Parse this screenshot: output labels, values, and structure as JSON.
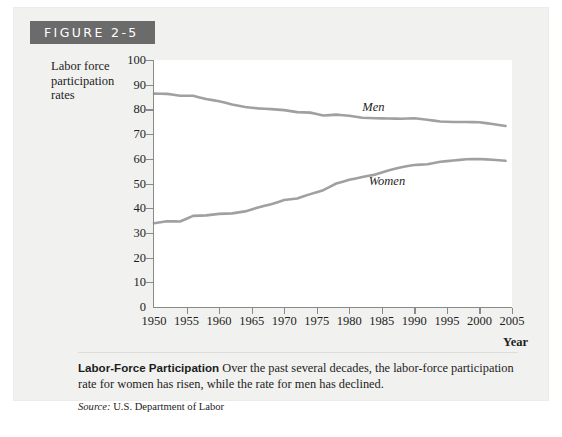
{
  "figure": {
    "number_label": "FIGURE 2-5",
    "header_bg": "#6b6b6b",
    "panel_bg": "#f1f1ef"
  },
  "caption": {
    "lead": "Labor-Force Participation",
    "body": "Over the past several decades, the labor-force participation rate for women has risen, while the rate for men has declined.",
    "source_label": "Source:",
    "source_value": "U.S. Department of Labor"
  },
  "chart_data": {
    "type": "line",
    "title": "",
    "xlabel": "Year",
    "ylabel": "Labor force participation rates",
    "ylabel_lines": [
      "Labor force",
      "participation",
      "rates"
    ],
    "xlim": [
      1950,
      2005
    ],
    "ylim": [
      0,
      100
    ],
    "xticks": [
      1950,
      1955,
      1960,
      1965,
      1970,
      1975,
      1980,
      1985,
      1990,
      1995,
      2000,
      2005
    ],
    "yticks": [
      0,
      10,
      20,
      30,
      40,
      50,
      60,
      70,
      80,
      90,
      100
    ],
    "grid": false,
    "legend": "inline-labels",
    "line_color": "#a0a0a0",
    "series": [
      {
        "name": "Men",
        "label_x": 1982,
        "label_y": 80.5,
        "x": [
          1950,
          1952,
          1954,
          1956,
          1958,
          1960,
          1962,
          1964,
          1966,
          1968,
          1970,
          1972,
          1974,
          1976,
          1978,
          1980,
          1982,
          1984,
          1986,
          1988,
          1990,
          1992,
          1994,
          1996,
          1998,
          2000,
          2002,
          2004
        ],
        "values": [
          86.4,
          86.3,
          85.5,
          85.5,
          84.2,
          83.3,
          82.0,
          81.0,
          80.4,
          80.1,
          79.7,
          78.9,
          78.7,
          77.5,
          77.9,
          77.4,
          76.6,
          76.4,
          76.3,
          76.2,
          76.4,
          75.8,
          75.1,
          74.9,
          74.9,
          74.8,
          74.1,
          73.3
        ]
      },
      {
        "name": "Women",
        "label_x": 1983,
        "label_y": 50.5,
        "x": [
          1950,
          1952,
          1954,
          1956,
          1958,
          1960,
          1962,
          1964,
          1966,
          1968,
          1970,
          1972,
          1974,
          1976,
          1978,
          1980,
          1982,
          1984,
          1986,
          1988,
          1990,
          1992,
          1994,
          1996,
          1998,
          2000,
          2002,
          2004
        ],
        "values": [
          33.9,
          34.7,
          34.6,
          36.9,
          37.1,
          37.7,
          37.9,
          38.7,
          40.3,
          41.6,
          43.3,
          43.9,
          45.7,
          47.3,
          50.0,
          51.5,
          52.6,
          53.6,
          55.3,
          56.6,
          57.5,
          57.8,
          58.8,
          59.3,
          59.8,
          59.9,
          59.6,
          59.2
        ]
      }
    ]
  }
}
